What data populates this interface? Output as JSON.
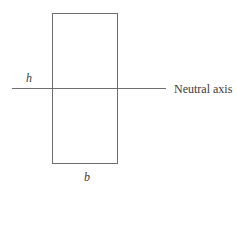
{
  "diagram": {
    "type": "rectangular cross-section with neutral axis",
    "labels": {
      "height": "h",
      "width": "b",
      "axis": "Neutral axis"
    },
    "colors": {
      "stroke": "#6e6e6e",
      "text": "#3a3a3a",
      "background": "#ffffff"
    }
  }
}
